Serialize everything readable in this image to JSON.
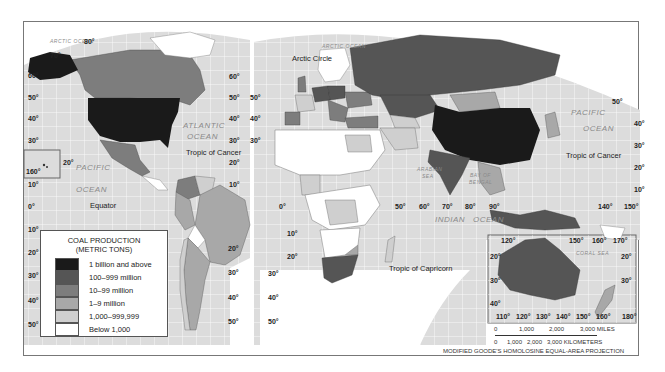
{
  "map": {
    "projection": "MODIFIED GOODE'S HOMOLOSINE EQUAL-AREA PROJECTION",
    "legend": {
      "title_line1": "COAL PRODUCTION",
      "title_line2": "(METRIC TONS)",
      "classes": [
        {
          "label": "1 billion and above",
          "color": "#1a1a1a"
        },
        {
          "label": "100–999 million",
          "color": "#555555"
        },
        {
          "label": "10–99 million",
          "color": "#7d7d7d"
        },
        {
          "label": "1–9 million",
          "color": "#a8a8a8"
        },
        {
          "label": "1,000–999,999",
          "color": "#cfcfcf"
        },
        {
          "label": "Below 1,000",
          "color": "#ffffff"
        }
      ]
    },
    "oceans": {
      "arctic_w": "ARCTIC OCEAN",
      "arctic_e": "ARCTIC OCEAN",
      "atlantic_1": "ATLANTIC",
      "atlantic_2": "OCEAN",
      "pacific_w1": "PACIFIC",
      "pacific_w2": "OCEAN",
      "pacific_e1": "PACIFIC",
      "pacific_e2": "OCEAN",
      "indian": "INDIAN",
      "indian_ocean": "OCEAN",
      "arabian_1": "ARABIAN",
      "arabian_2": "SEA",
      "bengal_1": "BAY OF",
      "bengal_2": "BENGAL",
      "coral": "CORAL SEA"
    },
    "lines": {
      "arctic_circle": "Arctic Circle",
      "tropic_cancer_w": "Tropic of Cancer",
      "tropic_cancer_e": "Tropic of Cancer",
      "equator": "Equator",
      "tropic_capricorn": "Tropic of Capricorn"
    },
    "graticule": {
      "lat_left": [
        "70°",
        "60°",
        "50°",
        "40°",
        "30°",
        "20°",
        "10°",
        "0°",
        "10°",
        "20°",
        "30°",
        "40°",
        "50°"
      ],
      "lon_labels": [
        "80°",
        "160°",
        "0°",
        "50°",
        "60°",
        "70°",
        "80°",
        "90°",
        "140°",
        "150°",
        "120°",
        "150°",
        "160°",
        "170°",
        "110°",
        "120°",
        "130°",
        "140°",
        "150°",
        "160°",
        "180°"
      ]
    },
    "regions": {
      "USA": "1 billion and above",
      "China": "1 billion and above",
      "Russia": "100–999 million",
      "India": "100–999 million",
      "Australia": "100–999 million",
      "South Africa": "100–999 million",
      "Kazakhstan": "100–999 million",
      "Germany": "100–999 million",
      "Poland": "100–999 million",
      "Indonesia": "100–999 million",
      "Canada": "10–99 million",
      "Mexico": "10–99 million",
      "Colombia": "10–99 million",
      "Turkey": "10–99 million",
      "Ukraine": "10–99 million",
      "Mongolia": "1–9 million",
      "Brazil": "1–9 million",
      "Argentina": "1–9 million",
      "Zimbabwe": "1–9 million",
      "New Zealand": "1–9 million"
    },
    "scale": {
      "miles": [
        "0",
        "1,000",
        "2,000",
        "3,000 MILES"
      ],
      "km": [
        "0",
        "1,000",
        "2,000",
        "3,000 KILOMETERS"
      ]
    }
  }
}
